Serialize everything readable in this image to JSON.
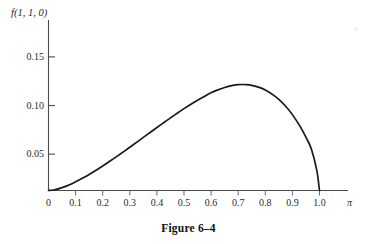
{
  "figure": {
    "caption": "Figure 6–4",
    "y_axis_title": "f(1, 1, 0)",
    "x_axis_title": "π"
  },
  "chart_data": {
    "type": "line",
    "title": "Figure 6–4",
    "xlabel": "π",
    "ylabel": "f(1, 1, 0)",
    "xlim": [
      0,
      1.08
    ],
    "ylim": [
      0,
      0.172
    ],
    "grid": false,
    "legend": null,
    "x_ticks": [
      0,
      0.1,
      0.2,
      0.3,
      0.4,
      0.5,
      0.6,
      0.7,
      0.8,
      0.9,
      1.0
    ],
    "x_tick_labels": [
      "0",
      "0.1",
      "0.2",
      "0.3",
      "0.4",
      "0.5",
      "0.6",
      "0.7",
      "0.8",
      "0.9",
      "1.0"
    ],
    "y_ticks": [
      0.05,
      0.1,
      0.15
    ],
    "y_tick_labels": [
      "0.05",
      "0.10",
      "0.15"
    ],
    "peak": {
      "x": 0.65,
      "y": 0.148
    },
    "series": [
      {
        "name": "f(1, 1, 0)",
        "color": "#1a1a1a",
        "x": [
          0.0,
          0.02,
          0.05,
          0.08,
          0.1,
          0.13,
          0.15,
          0.18,
          0.2,
          0.23,
          0.25,
          0.28,
          0.3,
          0.33,
          0.35,
          0.38,
          0.4,
          0.43,
          0.45,
          0.48,
          0.5,
          0.53,
          0.55,
          0.58,
          0.6,
          0.62,
          0.65,
          0.68,
          0.7,
          0.73,
          0.75,
          0.78,
          0.8,
          0.83,
          0.85,
          0.88,
          0.9,
          0.93,
          0.95,
          0.97,
          0.99,
          1.0
        ],
        "y": [
          0.0,
          0.0006,
          0.0032,
          0.0068,
          0.0097,
          0.0145,
          0.018,
          0.0236,
          0.0275,
          0.0336,
          0.0378,
          0.0442,
          0.0486,
          0.0552,
          0.0596,
          0.0663,
          0.0707,
          0.0772,
          0.0815,
          0.0878,
          0.0919,
          0.0977,
          0.1014,
          0.1065,
          0.1097,
          0.1124,
          0.1157,
          0.118,
          0.1189,
          0.1189,
          0.1181,
          0.1155,
          0.1128,
          0.1071,
          0.1022,
          0.0929,
          0.0852,
          0.0712,
          0.0598,
          0.0466,
          0.0225,
          0.0
        ]
      }
    ]
  },
  "axes": {
    "x_tick_labels": [
      "0",
      "0.1",
      "0.2",
      "0.3",
      "0.4",
      "0.5",
      "0.6",
      "0.7",
      "0.8",
      "0.9",
      "1.0"
    ],
    "y_tick_labels": [
      "0.05",
      "0.10",
      "0.15"
    ]
  }
}
